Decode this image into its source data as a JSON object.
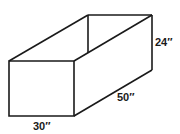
{
  "diagram": {
    "type": "open-top rectangular box (isometric sketch)",
    "dimensions": {
      "height_label": "24″",
      "length_label": "50″",
      "width_label": "30″"
    }
  }
}
